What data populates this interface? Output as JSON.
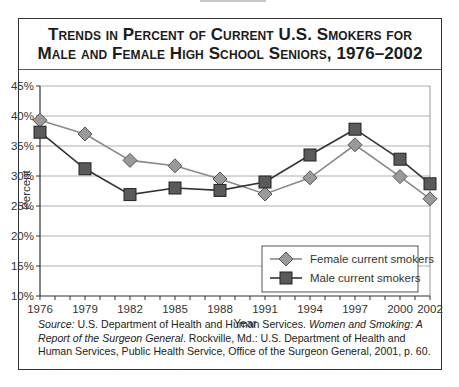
{
  "title": {
    "line1": "Trends in Percent of Current U.S. Smokers for",
    "line2": "Male and Female High School Seniors, 1976–2002"
  },
  "source": {
    "label": "Source:",
    "part1": " U.S. Department of Health and Human Services. ",
    "italic": "Women and Smoking: A Report of the Surgeon General",
    "part2": ". Rockville, Md.: U.S. Department of Health and Human Services, Public Health Service, Office of the Surgeon General, 2001, p. 60."
  },
  "colors": {
    "female_marker": "#9a9a9a",
    "female_line": "#8a8a8a",
    "male_marker": "#5a5a5a",
    "male_line": "#333333",
    "grid": "#b0b0b0"
  },
  "chart_data": {
    "type": "line",
    "title": "Trends in Percent of Current U.S. Smokers for Male and Female High School Seniors, 1976–2002",
    "xlabel": "Year",
    "ylabel": "Percent",
    "x": [
      1976,
      1979,
      1982,
      1985,
      1988,
      1991,
      1994,
      1997,
      2000,
      2002
    ],
    "x_tick_labels": [
      "1976",
      "1979",
      "1982",
      "1985",
      "1988",
      "1991",
      "1994",
      "1997",
      "2000",
      "2002"
    ],
    "y_tick_labels": [
      "10%",
      "15%",
      "20%",
      "25%",
      "30%",
      "35%",
      "40%",
      "45%"
    ],
    "ylim": [
      10,
      45
    ],
    "xlim": [
      1976,
      2002
    ],
    "grid": true,
    "legend_position": "lower right",
    "series": [
      {
        "name": "Female current smokers",
        "marker": "diamond",
        "values": [
          39.3,
          37.0,
          32.6,
          31.7,
          29.5,
          27.0,
          29.7,
          35.2,
          29.9,
          26.2
        ]
      },
      {
        "name": "Male current smokers",
        "marker": "square",
        "values": [
          37.3,
          31.2,
          26.9,
          28.0,
          27.6,
          29.0,
          33.5,
          37.8,
          32.8,
          28.7
        ]
      }
    ]
  }
}
